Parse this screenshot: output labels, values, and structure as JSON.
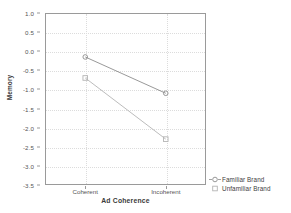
{
  "chart_data": {
    "type": "line",
    "title": "",
    "xlabel": "Ad Coherence",
    "ylabel": "Memory",
    "categories": [
      "Coherent",
      "Incoherent"
    ],
    "series": [
      {
        "name": "Familiar Brand",
        "marker": "open-circle",
        "color": "#8d8d8d",
        "values": [
          -0.15,
          -1.1
        ]
      },
      {
        "name": "Unfamiliar Brand",
        "marker": "open-square",
        "color": "#b4b4b4",
        "values": [
          -0.7,
          -2.3
        ]
      }
    ],
    "ylim": [
      -3.5,
      1.0
    ],
    "yticks": [
      1.0,
      0.5,
      0.0,
      -0.5,
      -1.0,
      -1.5,
      -2.0,
      -2.5,
      -3.0,
      -3.5
    ],
    "ytick_labels": [
      "1.0",
      "0.5",
      "0.0",
      "-0.5",
      "-1.0",
      "-1.5",
      "-2.0",
      "-2.5",
      "-3.0",
      "-3.5"
    ],
    "grid": true,
    "legend_position": "right-bottom"
  },
  "axes": {
    "y_title": "Memory",
    "x_title": "Ad Coherence"
  },
  "legend": {
    "entries": [
      {
        "label": "Familiar Brand",
        "marker": "open-circle-marker"
      },
      {
        "label": "Unfamiliar Brand",
        "marker": "open-square-marker"
      }
    ]
  }
}
